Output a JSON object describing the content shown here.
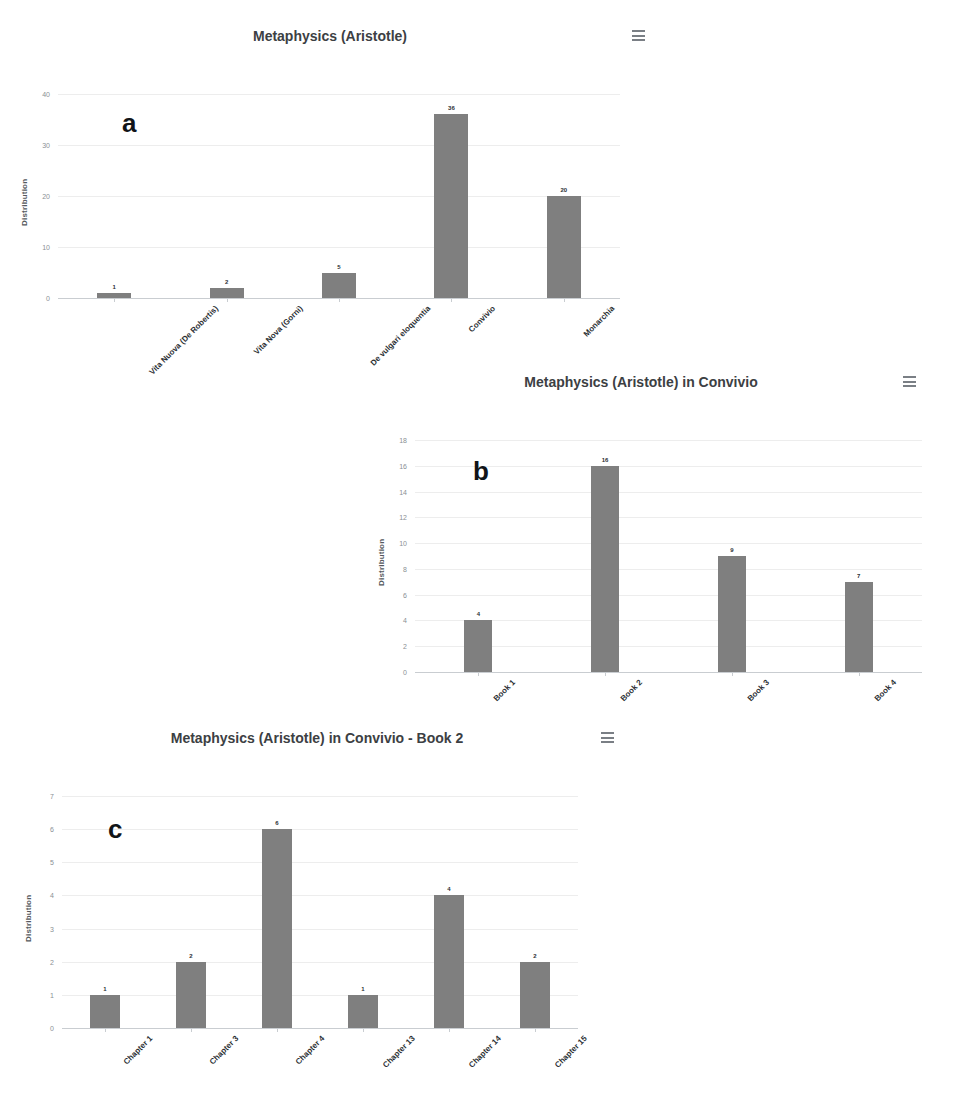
{
  "figure": {
    "panels": [
      {
        "letter": "a",
        "title": "Metaphysics (Aristotle)",
        "menu_icon": "hamburger-menu-icon"
      },
      {
        "letter": "b",
        "title": "Metaphysics (Aristotle) in Convivio",
        "menu_icon": "hamburger-menu-icon"
      },
      {
        "letter": "c",
        "title": "Metaphysics (Aristotle) in Convivio - Book 2",
        "menu_icon": "hamburger-menu-icon"
      }
    ]
  },
  "colors": {
    "bar": "#7f7f7f",
    "grid": "#ededed",
    "axis": "#c9cdd1",
    "title": "#3c4043",
    "tick": "#8a8f94"
  },
  "chart_data": [
    {
      "type": "bar",
      "title": "Metaphysics (Aristotle)",
      "xlabel": "",
      "ylabel": "Distribution",
      "categories": [
        "Vita Nuova (De Robertis)",
        "Vita Nova (Gorni)",
        "De vulgari eloquentia",
        "Convivio",
        "Monarchia"
      ],
      "values": [
        1,
        2,
        5,
        36,
        20
      ],
      "value_labels": [
        "1",
        "2",
        "5",
        "36",
        "20"
      ],
      "ylim": [
        0,
        40
      ],
      "yticks": [
        0,
        10,
        20,
        30,
        40
      ],
      "ytick_labels": [
        "0",
        "10",
        "20",
        "30",
        "40"
      ],
      "grid": true,
      "legend": "none"
    },
    {
      "type": "bar",
      "title": "Metaphysics (Aristotle) in Convivio",
      "xlabel": "",
      "ylabel": "Distribution",
      "categories": [
        "Book 1",
        "Book 2",
        "Book 3",
        "Book 4"
      ],
      "values": [
        4,
        16,
        9,
        7
      ],
      "value_labels": [
        "4",
        "16",
        "9",
        "7"
      ],
      "ylim": [
        0,
        18
      ],
      "yticks": [
        0,
        2,
        4,
        6,
        8,
        10,
        12,
        14,
        16,
        18
      ],
      "ytick_labels": [
        "0",
        "2",
        "4",
        "6",
        "8",
        "10",
        "12",
        "14",
        "16",
        "18"
      ],
      "grid": true,
      "legend": "none"
    },
    {
      "type": "bar",
      "title": "Metaphysics (Aristotle) in Convivio - Book 2",
      "xlabel": "",
      "ylabel": "Distribution",
      "categories": [
        "Chapter 1",
        "Chapter 3",
        "Chapter 4",
        "Chapter 13",
        "Chapter 14",
        "Chapter 15"
      ],
      "values": [
        1,
        2,
        6,
        1,
        4,
        2
      ],
      "value_labels": [
        "1",
        "2",
        "6",
        "1",
        "4",
        "2"
      ],
      "ylim": [
        0,
        7
      ],
      "yticks": [
        0,
        1,
        2,
        3,
        4,
        5,
        6,
        7
      ],
      "ytick_labels": [
        "0",
        "1",
        "2",
        "3",
        "4",
        "5",
        "6",
        "7"
      ],
      "grid": true,
      "legend": "none"
    }
  ]
}
